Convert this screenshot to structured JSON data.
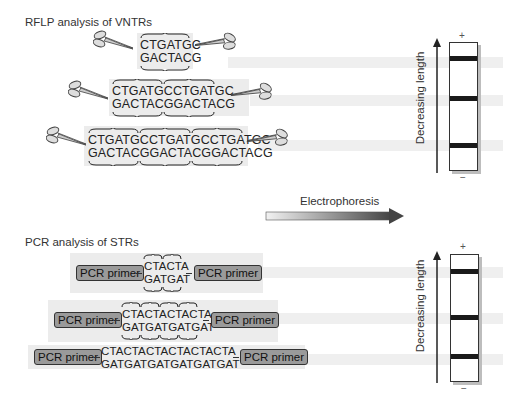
{
  "rflp": {
    "title": "RFLP analysis of VNTRs",
    "rows": [
      {
        "top": "CTGATGC",
        "bottom": "GACTACG",
        "repeats": 1
      },
      {
        "top": "CTGATGCCTGATGC",
        "bottom": "GACTACGGACTACG",
        "repeats": 2
      },
      {
        "top": "CTGATGCCTGATGCCTGATGC",
        "bottom": "GACTACGGACTACGGACTACG",
        "repeats": 3
      }
    ],
    "gel": {
      "plus": "+",
      "minus": "−",
      "axis_label": "Decreasing length"
    }
  },
  "electrophoresis": {
    "label": "Electrophoresis"
  },
  "pcr": {
    "title": "PCR analysis of STRs",
    "primer_label": "PCR primer",
    "rows": [
      {
        "top": "CTACTA",
        "bottom": "GATGAT",
        "repeats": 2
      },
      {
        "top": "CTACTACTACTA",
        "bottom": "GATGATGATGAT",
        "repeats": 4
      },
      {
        "top": "CTACTACTACTACTACTA",
        "bottom": "GATGATGATGATGATGAT",
        "repeats": 6
      }
    ],
    "gel": {
      "plus": "+",
      "minus": "−",
      "axis_label": "Decreasing length"
    }
  },
  "icons": {
    "cut_site": "scissors-icon",
    "direction": "arrow-right-icon",
    "axis": "arrow-up-icon"
  }
}
